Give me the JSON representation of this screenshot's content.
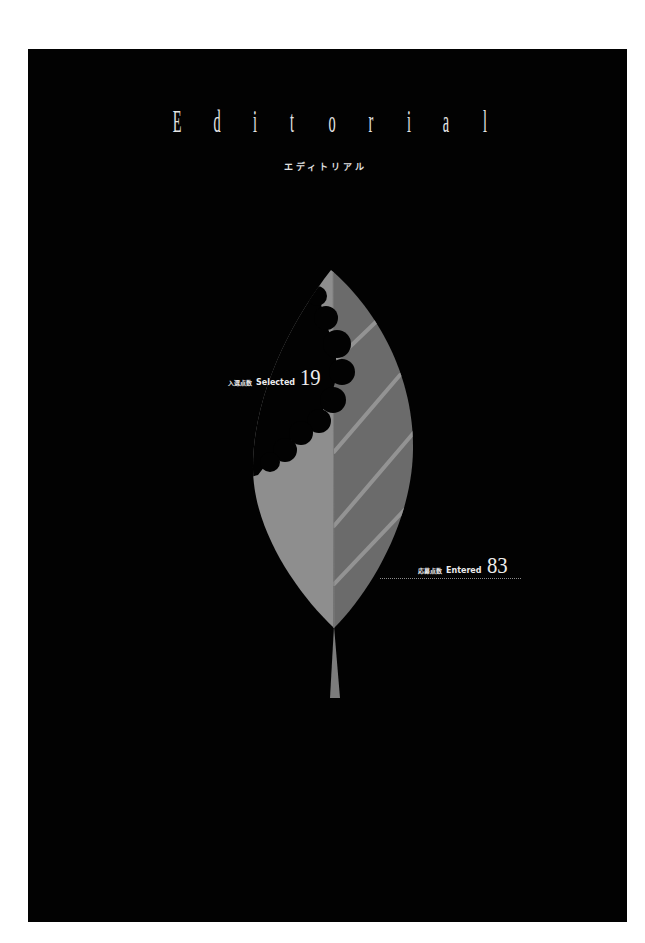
{
  "page": {
    "background_color": "#020202",
    "margin_color": "#ffffff"
  },
  "header": {
    "title_letters": [
      "E",
      "d",
      "i",
      "t",
      "o",
      "r",
      "i",
      "a",
      "l"
    ],
    "subtitle": "エディトリアル"
  },
  "illustration": {
    "subject": "leaf-with-bite",
    "colors": {
      "leaf_left": "#8e8e8e",
      "leaf_right": "#6b6b6b",
      "vein": "#939393",
      "stem": "#7c7c7c",
      "bite": "#020202"
    }
  },
  "stats": {
    "selected": {
      "label_jp": "入選点数",
      "label_en": "Selected",
      "value": "19"
    },
    "entered": {
      "label_jp": "応募点数",
      "label_en": "Entered",
      "value": "83"
    }
  }
}
